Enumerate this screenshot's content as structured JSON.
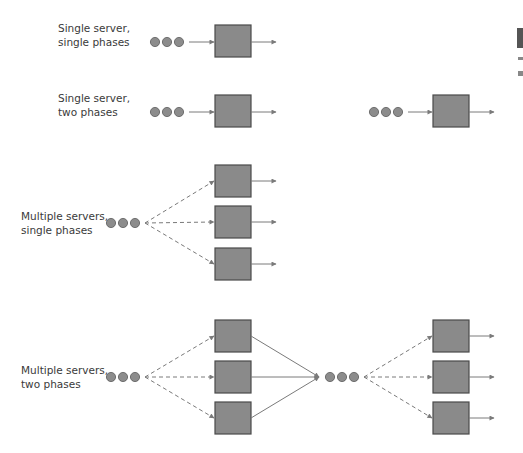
{
  "diagram": {
    "rows": [
      {
        "id": "single-server-single-phase",
        "label_line1": "Single server,",
        "label_line2": "single phases",
        "servers_per_phase": 1,
        "phases": 1
      },
      {
        "id": "single-server-two-phase",
        "label_line1": "Single server,",
        "label_line2": "two phases",
        "servers_per_phase": 1,
        "phases": 2
      },
      {
        "id": "multi-server-single-phase",
        "label_line1": "Multiple servers,",
        "label_line2": "single phases",
        "servers_per_phase": 3,
        "phases": 1
      },
      {
        "id": "multi-server-two-phase",
        "label_line1": "Multiple servers,",
        "label_line2": "two phases",
        "servers_per_phase": 3,
        "phases": 2
      }
    ],
    "queue_glyph": "three-circle-queue",
    "server_glyph": "square-server",
    "colors": {
      "server_fill": "#8a8a8a",
      "server_border": "#4a4a4a",
      "queue_fill": "#8c8c8c",
      "queue_border": "#5a5a5a",
      "arrow": "#7a7a7a",
      "text": "#3a3a3a"
    }
  }
}
